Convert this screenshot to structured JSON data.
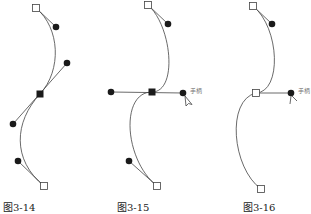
{
  "figures": [
    {
      "caption": "图3-14"
    },
    {
      "caption": "图3-15",
      "handle_label": "手柄"
    },
    {
      "caption": "图3-16",
      "handle_label": "手柄"
    }
  ],
  "colors": {
    "stroke": "#444444",
    "point": "#1a1a1a"
  }
}
